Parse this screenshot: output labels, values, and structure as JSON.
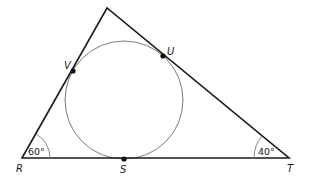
{
  "diagram": {
    "vertices": {
      "R": {
        "label": "R",
        "x": 22,
        "y": 158
      },
      "T": {
        "label": "T",
        "x": 289,
        "y": 158
      },
      "apex": {
        "label": "",
        "x": 107,
        "y": 8
      }
    },
    "circle": {
      "cx": 124,
      "cy": 100,
      "r": 59
    },
    "tangent_points": {
      "V": {
        "label": "V",
        "x": 73,
        "y": 71
      },
      "U": {
        "label": "U",
        "x": 163,
        "y": 56
      },
      "S": {
        "label": "S",
        "x": 124,
        "y": 159
      }
    },
    "angles": {
      "R": {
        "label": "60°"
      },
      "T": {
        "label": "40°"
      }
    },
    "colors": {
      "triangle": "#1a1a1a",
      "circle": "#777777",
      "point": "#111111"
    }
  }
}
